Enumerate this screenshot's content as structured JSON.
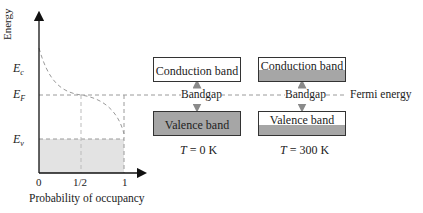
{
  "graph": {
    "y_axis_label": "Energy",
    "x_axis_label": "Probability of occupancy",
    "energy_levels": [
      {
        "symbol": "E",
        "sub": "c",
        "name": "conduction band edge"
      },
      {
        "symbol": "E",
        "sub": "F",
        "name": "Fermi level"
      },
      {
        "symbol": "E",
        "sub": "v",
        "name": "valence band edge"
      }
    ],
    "x_ticks": [
      "0",
      "1/2",
      "1"
    ],
    "curve": "Fermi-Dirac distribution (dashed)",
    "shaded_region": "below E_v, probability 0 to 1"
  },
  "band_diagrams": [
    {
      "temperature_label": "T",
      "temperature_value": "= 0 K",
      "conduction_band": {
        "label": "Conduction band",
        "fill_fraction": 0
      },
      "gap_label": "Bandgap",
      "valence_band": {
        "label": "Valence band",
        "fill_fraction": 1
      }
    },
    {
      "temperature_label": "T",
      "temperature_value": "= 300 K",
      "conduction_band": {
        "label": "Conduction band",
        "fill_fraction": 0.5
      },
      "gap_label": "Bandgap",
      "valence_band": {
        "label": "Valence band",
        "fill_fraction": 0.45
      }
    }
  ],
  "fermi_energy_label": "Fermi energy",
  "colors": {
    "band_fill": "#a6a6a6",
    "shaded_region": "#e3e3e3",
    "arrow": "#8a8a8a",
    "dashed": "#9a9a9a"
  }
}
